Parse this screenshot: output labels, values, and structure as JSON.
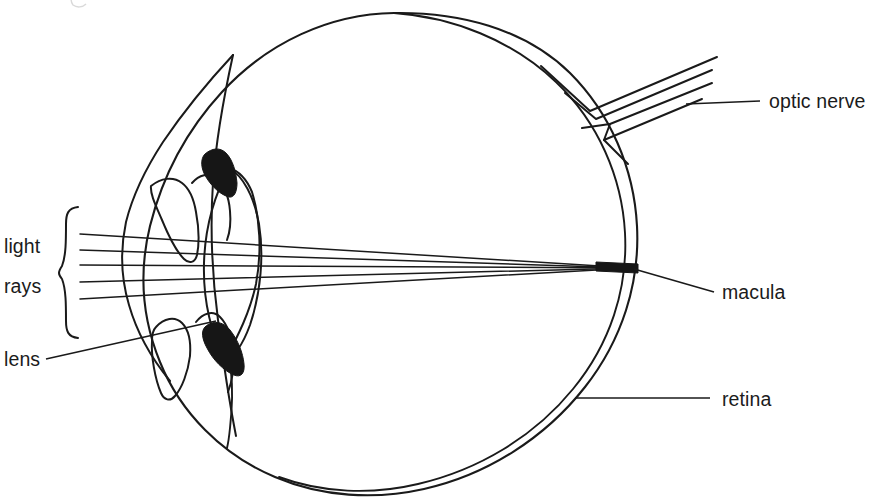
{
  "figure": {
    "type": "anatomical-line-diagram",
    "background_color": "#ffffff",
    "ink_color": "#1a1a1a",
    "width": 876,
    "height": 504
  },
  "labels": {
    "light_rays_line1": "light",
    "light_rays_line2": "rays",
    "lens": "lens",
    "optic_nerve": "optic nerve",
    "macula": "macula",
    "retina": "retina"
  },
  "structures": [
    {
      "name": "sclera-outer",
      "label": null,
      "description": "outer eyeball wall, large circle drawn freehand"
    },
    {
      "name": "retina-inner",
      "label": "retina",
      "description": "inner concentric wall line forming the retina layer"
    },
    {
      "name": "cornea",
      "label": null,
      "description": "anterior transparent dome at left of the globe"
    },
    {
      "name": "iris-upper",
      "label": null,
      "description": "upper iris flap"
    },
    {
      "name": "iris-lower",
      "label": null,
      "description": "lower iris flap"
    },
    {
      "name": "lens",
      "label": "lens",
      "description": "biconvex lens between the iris flaps"
    },
    {
      "name": "ciliary-body-upper",
      "label": null,
      "description": "solid black wedge above the lens"
    },
    {
      "name": "ciliary-body-lower",
      "label": null,
      "description": "solid black wedge below the lens"
    },
    {
      "name": "optic-nerve",
      "label": "optic nerve",
      "description": "nerve bundle leaving the globe at upper right, drawn as parallel lines"
    },
    {
      "name": "macula",
      "label": "macula",
      "description": "focal point on the retina where the rays converge"
    }
  ],
  "light_rays": {
    "count": 5,
    "origin_side": "left",
    "converges_at": "macula",
    "focus_point": {
      "x": 632,
      "y": 268
    },
    "start_x": 80,
    "start_y_values": [
      234,
      250,
      265,
      282,
      299
    ]
  },
  "leader_lines": [
    {
      "name": "optic-nerve-leader",
      "from": {
        "x": 760,
        "y": 101
      },
      "to": {
        "x": 686,
        "y": 104
      }
    },
    {
      "name": "macula-leader",
      "from": {
        "x": 714,
        "y": 292
      },
      "to": {
        "x": 634,
        "y": 269
      }
    },
    {
      "name": "retina-leader",
      "from": {
        "x": 710,
        "y": 398
      },
      "to": {
        "x": 575,
        "y": 398
      }
    },
    {
      "name": "lens-leader",
      "from": {
        "x": 46,
        "y": 359
      },
      "to": {
        "x": 216,
        "y": 321
      }
    }
  ],
  "brace": {
    "name": "light-rays-brace",
    "orientation": "left-facing",
    "top_y": 207,
    "bottom_y": 338,
    "x": 70
  }
}
